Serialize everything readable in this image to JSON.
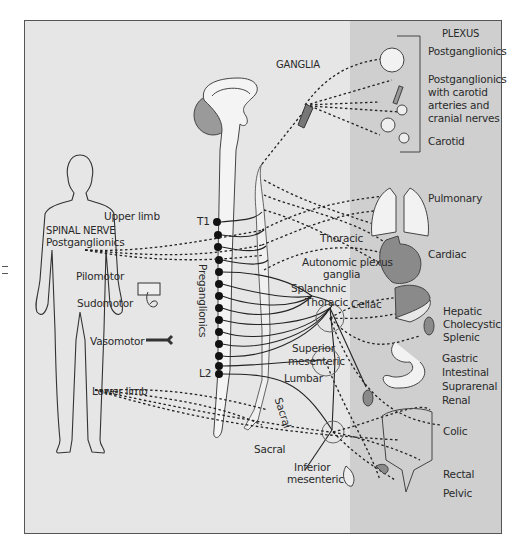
{
  "diagram": {
    "type": "autonomic-nervous-system-sympathetic-division",
    "colors": {
      "background": "#e6e6e6",
      "right_panel": "#cfcfcf",
      "frame_border": "#555555",
      "organ_fill": "#8a8a8a",
      "line": "#222222",
      "text": "#2a2a2a"
    }
  },
  "headers": {
    "ganglia": "GANGLIA",
    "plexus": "PLEXUS",
    "spinal_nerve": "SPINAL NERVE"
  },
  "spinal_nerve": {
    "postganglionics": "Postganglionics",
    "upper_limb": "Upper limb",
    "pilomotor": "Pilomotor",
    "sudomotor": "Sudomotor",
    "vasomotor": "Vasomotor",
    "lower_limb": "Lower limb"
  },
  "spinal_cord": {
    "t1": "T1",
    "l2": "L2",
    "preganglionics": "Preganglionics"
  },
  "ganglia_labels": {
    "thoracic_upper": "Thoracic",
    "autonomic_plexus_ganglia_1": "Autonomic plexus",
    "autonomic_plexus_ganglia_2": "ganglia",
    "splanchnic": "Splanchnic",
    "thoracic_lower": "Thoracic",
    "celiac": "Celiac",
    "superior_mesenteric_1": "Superior",
    "superior_mesenteric_2": "mesenteric",
    "lumbar": "Lumbar",
    "sacral_chain": "Sacral",
    "sacral": "Sacral",
    "inferior_mesenteric_1": "Inferior",
    "inferior_mesenteric_2": "mesenteric"
  },
  "plexus": {
    "head": {
      "postganglionics": "Postganglionics",
      "with_carotid_1": "Postganglionics",
      "with_carotid_2": "with carotid",
      "with_carotid_3": "arteries and",
      "with_carotid_4": "cranial nerves",
      "carotid": "Carotid"
    },
    "pulmonary": "Pulmonary",
    "cardiac": "Cardiac",
    "hepatic": "Hepatic",
    "cholecystic": "Cholecystic",
    "splenic": "Splenic",
    "gastric": "Gastric",
    "intestinal": "Intestinal",
    "suprarenal": "Suprarenal",
    "renal": "Renal",
    "colic": "Colic",
    "rectal": "Rectal",
    "pelvic": "Pelvic"
  }
}
